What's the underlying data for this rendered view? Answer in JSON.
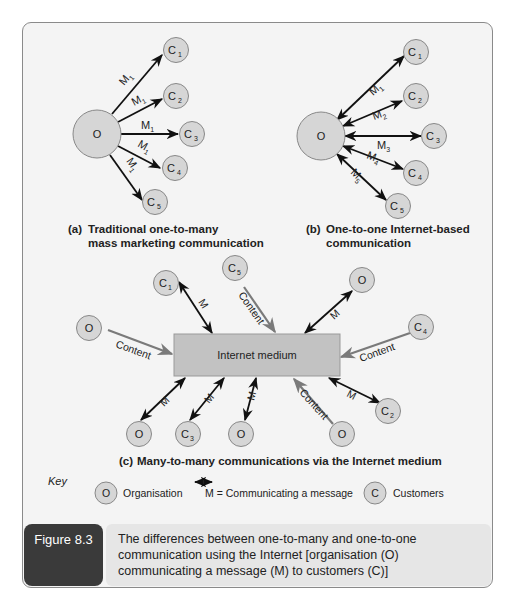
{
  "colors": {
    "node_fill": "#d6d6d6",
    "node_stroke": "#888888",
    "medium_fill": "#c2c2c2",
    "message_arrow": "#111111",
    "content_arrow": "#7a7a7a",
    "panel_bg": "#f4f4f4",
    "caption_dark": "#3a3a3a",
    "caption_light": "#e6e6e6"
  },
  "diagram_a": {
    "center_label": "O",
    "customers": [
      "C1",
      "C2",
      "C3",
      "C4",
      "C5"
    ],
    "messages": [
      "M1",
      "M1",
      "M1",
      "M1",
      "M1"
    ],
    "caption_prefix": "(a)",
    "caption_line1": "Traditional one-to-many",
    "caption_line2": "mass marketing communication"
  },
  "diagram_b": {
    "center_label": "O",
    "customers": [
      "C1",
      "C2",
      "C3",
      "C4",
      "C5"
    ],
    "messages": [
      "M1",
      "M2",
      "M3",
      "M4",
      "M5"
    ],
    "caption_prefix": "(b)",
    "caption_line1": "One-to-one Internet-based",
    "caption_line2": "communication"
  },
  "diagram_c": {
    "medium_label": "Internet medium",
    "nodes": {
      "c1": "C1",
      "c5": "C5",
      "o_top_right": "O",
      "o_left": "O",
      "c4": "C4",
      "o_bottom_1": "O",
      "c3": "C3",
      "o_bottom_2": "O",
      "o_bottom_3": "O",
      "c2": "C2"
    },
    "message_label": "M",
    "content_label": "Content",
    "caption_prefix": "(c)",
    "caption": "Many-to-many communications via the Internet medium"
  },
  "key": {
    "title": "Key",
    "organisation_symbol": "O",
    "organisation_label": "Organisation",
    "message_label": "M = Communicating a message",
    "customer_symbol": "C",
    "customer_label": "Customers"
  },
  "figure": {
    "label": "Figure 8.3",
    "caption": "The differences between one-to-many and one-to-one communication using the Internet [organisation (O) communicating a message (M) to customers (C)]"
  }
}
